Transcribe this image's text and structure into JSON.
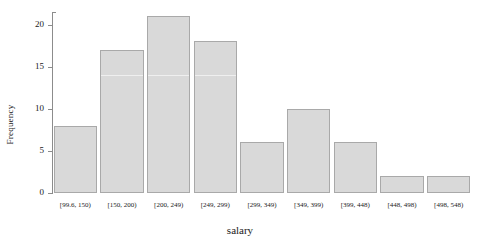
{
  "chart_data": {
    "type": "bar",
    "title": "",
    "xlabel": "salary",
    "ylabel": "Frequency",
    "categories": [
      "[99.6, 150)",
      "[150, 200)",
      "[200, 249)",
      "[249, 299)",
      "[299, 349)",
      "[349, 399)",
      "[399, 448)",
      "[448, 498)",
      "[498, 548)"
    ],
    "values": [
      8,
      17,
      21,
      18,
      6,
      10,
      6,
      2,
      2
    ],
    "ylim": [
      0,
      21.5
    ],
    "yticks": [
      0,
      5,
      10,
      15,
      20
    ],
    "ytick_labels": [
      "0",
      "5",
      "10",
      "15",
      "20"
    ],
    "grid": false,
    "legend": null,
    "bar_fill": "#d9d9d9",
    "bar_edge": "#a9a9a9",
    "axis_color": "#8c8c8c",
    "text_color": "#1a1a1a"
  }
}
